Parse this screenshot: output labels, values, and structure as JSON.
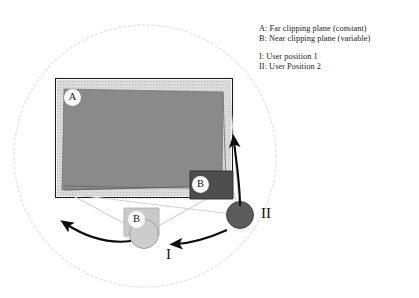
{
  "diagram": {
    "legend": {
      "line_a": "A: Far clipping plane (constant)",
      "line_b": "B: Near clipping plane (variable)",
      "line_i": "I: User position 1",
      "line_ii": "II: User Position 2"
    },
    "labels": {
      "far_plane": "A",
      "near_plane_pos1": "B",
      "near_plane_pos2": "B",
      "user_pos_1": "I",
      "user_pos_2": "II"
    },
    "colors": {
      "background": "#ffffff",
      "far_plane_fill": "#8a8a8a",
      "far_plane_band": "#dcdcdc",
      "far_plane_border": "#1a1a1a",
      "near_plane_pos1_fill": "#c9c9c9",
      "near_plane_pos2_fill": "#4e4e4e",
      "user_1_marker": "#cccccc",
      "user_2_marker": "#5b5b5b",
      "frustum_line": "#cfcfcf",
      "clipping_sphere": "#e2e2e2",
      "arrow": "#0d0d0d",
      "text": "#1a1a1a"
    },
    "geometry": {
      "clipping_sphere_center_x": 145,
      "clipping_sphere_center_y": 156,
      "clipping_sphere_radius": 131,
      "user_1_center_x": 144,
      "user_1_center_y": 234,
      "user_1_radius": 14,
      "user_2_center_x": 240,
      "user_2_center_y": 215,
      "user_2_radius": 13
    }
  }
}
